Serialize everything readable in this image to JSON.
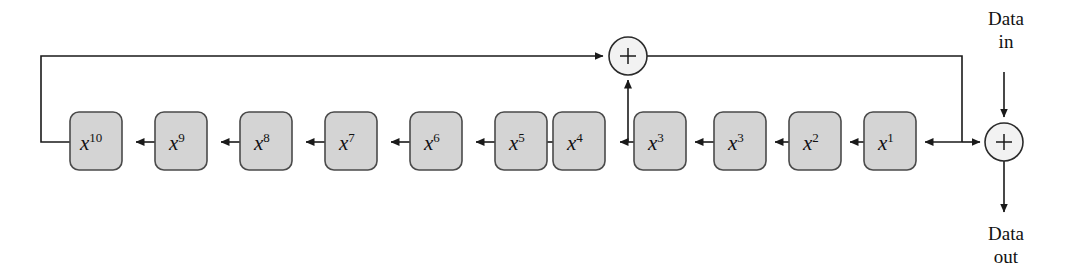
{
  "diagram": {
    "colors": {
      "box_fill": "#d4d4d4",
      "box_stroke": "#4a4a4a",
      "adder_fill": "#f2f2f2",
      "adder_stroke": "#2b2b2b",
      "wire": "#1a1a1a",
      "background": "#ffffff"
    },
    "registers": [
      {
        "base": "x",
        "exponent": "10",
        "x": 70,
        "y": 112
      },
      {
        "base": "x",
        "exponent": "9",
        "x": 155,
        "y": 112
      },
      {
        "base": "x",
        "exponent": "8",
        "x": 240,
        "y": 112
      },
      {
        "base": "x",
        "exponent": "7",
        "x": 325,
        "y": 112
      },
      {
        "base": "x",
        "exponent": "6",
        "x": 410,
        "y": 112
      },
      {
        "base": "x",
        "exponent": "5",
        "x": 495,
        "y": 112
      },
      {
        "base": "x",
        "exponent": "4",
        "x": 553,
        "y": 112
      },
      {
        "base": "x",
        "exponent": "3",
        "x": 634,
        "y": 112
      },
      {
        "base": "x",
        "exponent": "3",
        "x": 714,
        "y": 112
      },
      {
        "base": "x",
        "exponent": "2",
        "x": 789,
        "y": 112
      },
      {
        "base": "x",
        "exponent": "1",
        "x": 864,
        "y": 112
      }
    ],
    "register_size": {
      "width": 52,
      "height": 58,
      "radius": 9
    },
    "adders": [
      {
        "name": "top-adder",
        "symbol": "+",
        "cx": 628,
        "cy": 56,
        "r": 19
      },
      {
        "name": "input-adder",
        "symbol": "+",
        "cx": 1004,
        "cy": 142,
        "r": 19
      }
    ],
    "io_labels": {
      "data_in_line1": "Data",
      "data_in_line2": "in",
      "data_out_line1": "Data",
      "data_out_line2": "out"
    }
  }
}
